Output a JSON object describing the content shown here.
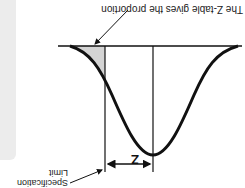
{
  "orientation": "rotated-180",
  "labels": {
    "callout_top": "The Z-table gives the proportion",
    "spec_limit_line1": "Specification",
    "spec_limit_line2": "Limit",
    "z_label": "Z"
  },
  "colors": {
    "curve": "#111111",
    "shade": "#d4d4d4",
    "sidebar": "#ececec"
  }
}
